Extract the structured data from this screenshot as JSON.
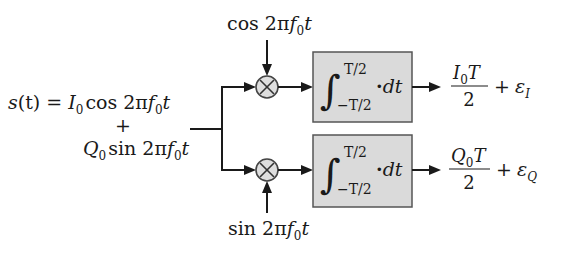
{
  "diagram": {
    "type": "quadrature-correlator-block-diagram",
    "input": {
      "lhs": "s",
      "arg": "(t)",
      "eq": " = ",
      "term1_coef": "I",
      "term1_sub": "0",
      "term1_func": "cos 2π",
      "term1_f": "f",
      "term1_fsub": "0",
      "term1_t": "t",
      "plus": "+",
      "term2_coef": "Q",
      "term2_sub": "0",
      "term2_func": "sin 2π",
      "term2_f": "f",
      "term2_fsub": "0",
      "term2_t": "t"
    },
    "branches": [
      {
        "name": "in-phase",
        "reference": {
          "func": "cos 2π",
          "f": "f",
          "fsub": "0",
          "t": "t"
        },
        "multiplier_symbol": "×",
        "integrator": {
          "integral": "∫",
          "upper": "T/2",
          "lower": "−T/2",
          "integrand": "·",
          "d": "d",
          "t": "t"
        },
        "output": {
          "num_coef": "I",
          "num_sub": "0",
          "num_T": "T",
          "den": "2",
          "plus": "+",
          "eps": "ε",
          "eps_sub": "I"
        }
      },
      {
        "name": "quadrature",
        "reference": {
          "func": "sin 2π",
          "f": "f",
          "fsub": "0",
          "t": "t"
        },
        "multiplier_symbol": "×",
        "integrator": {
          "integral": "∫",
          "upper": "T/2",
          "lower": "−T/2",
          "integrand": "·",
          "d": "d",
          "t": "t"
        },
        "output": {
          "num_coef": "Q",
          "num_sub": "0",
          "num_T": "T",
          "den": "2",
          "plus": "+",
          "eps": "ε",
          "eps_sub": "Q"
        }
      }
    ],
    "colors": {
      "line": "#1a1a1a",
      "box_fill": "#dadada",
      "box_border": "#555555",
      "multiplier_fill": "#dedede"
    }
  }
}
